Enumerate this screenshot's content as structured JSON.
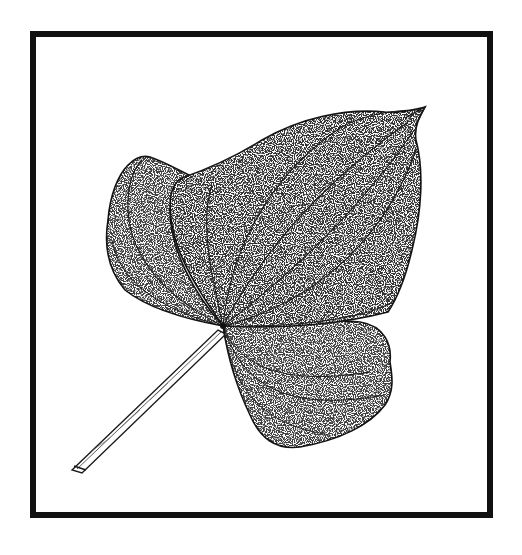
{
  "illustration": {
    "subject": "Botanical stipple drawing of a heart-shaped leaf with stem",
    "style": "black ink stippling on white",
    "frame_color": "#111111",
    "ink_color": "#1a1a1a",
    "background": "#ffffff"
  }
}
